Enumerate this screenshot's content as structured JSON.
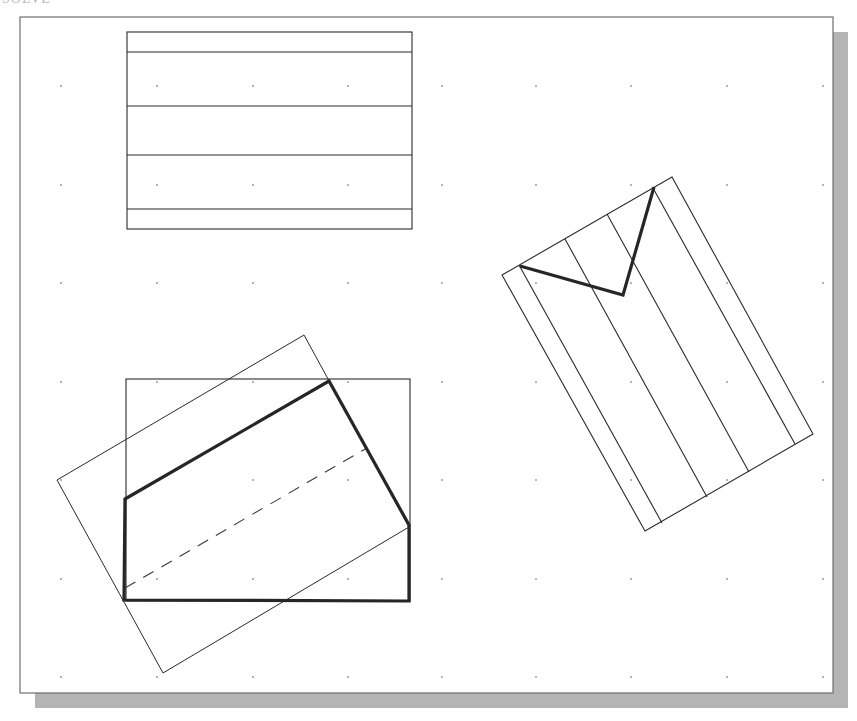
{
  "canvas": {
    "width": 857,
    "height": 721,
    "background": "#ffffff"
  },
  "frame": {
    "x": 20,
    "y": 17,
    "width": 813,
    "height": 676,
    "border_color": "#6e6e6e",
    "shadow_color": "#b4b4b4",
    "shadow_offset": 15
  },
  "grid": {
    "dot_color": "#8a8a8a",
    "columns": [
      61,
      157,
      253,
      348,
      442,
      536,
      631,
      727,
      823
    ],
    "rows": [
      86,
      185,
      283,
      382,
      480,
      579,
      677
    ]
  },
  "colors": {
    "thin_line": "#2a2a2a",
    "thick_line": "#262626",
    "dashed_line": "#3a3a3a"
  },
  "shapes": {
    "top_rectangle": {
      "x": 127,
      "y": 32,
      "width": 285,
      "height": 197,
      "horizontal_lines_y": [
        52,
        106,
        155,
        209
      ]
    },
    "right_rotated_rectangle": {
      "corners": [
        [
          502,
          275
        ],
        [
          672,
          177
        ],
        [
          813,
          434
        ],
        [
          645,
          531
        ]
      ],
      "internal_lines": [
        [
          [
            519,
            265
          ],
          [
            662,
            523
          ]
        ],
        [
          [
            565,
            239
          ],
          [
            707,
            497
          ]
        ],
        [
          [
            607,
            214
          ],
          [
            749,
            472
          ]
        ],
        [
          [
            653,
            188
          ],
          [
            795,
            444
          ]
        ]
      ],
      "thick_polyline": [
        [
          520,
          266
        ],
        [
          623,
          295
        ],
        [
          654,
          187
        ]
      ]
    },
    "bottom_left_group": {
      "axis_rectangle": {
        "x": 126,
        "y": 379,
        "width": 284,
        "height": 222
      },
      "rotated_rectangle": {
        "corners": [
          [
            304,
            335
          ],
          [
            409,
            527
          ],
          [
            163,
            673
          ],
          [
            57,
            480
          ]
        ]
      },
      "thick_polygon": [
        [
          125,
          499
        ],
        [
          329,
          381
        ],
        [
          409,
          525
        ],
        [
          409,
          601
        ],
        [
          124,
          600
        ]
      ],
      "dashed_line": {
        "from": [
          125,
          588
        ],
        "to": [
          367,
          448
        ],
        "dash": "12 9"
      }
    }
  },
  "cut_off_text": "SOLVE"
}
